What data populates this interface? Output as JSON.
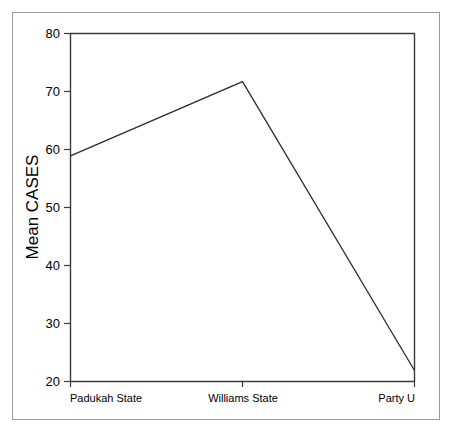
{
  "chart_data": {
    "type": "line",
    "title": "",
    "xlabel": "",
    "ylabel": "Mean CASES",
    "categories": [
      "Padukah State",
      "Williams State",
      "Party U"
    ],
    "values": [
      58.9,
      71.7,
      21.9
    ],
    "series": [
      {
        "name": "Mean CASES",
        "values": [
          58.9,
          71.7,
          21.9
        ]
      }
    ],
    "ylim": [
      20,
      80
    ],
    "yticks": [
      20,
      30,
      40,
      50,
      60,
      70,
      80
    ],
    "ytick_labels": [
      "20",
      "30",
      "40",
      "50",
      "60",
      "70",
      "80"
    ],
    "grid": false,
    "legend": false,
    "legend_position": "none",
    "line_color": "#2b2b2b",
    "axis_color": "#3a3a3a",
    "frame_color": "#9a9a9a",
    "background_color": "#ffffff"
  },
  "axis": {
    "y_title": "Mean CASES",
    "ticks": {
      "t80": "80",
      "t70": "70",
      "t60": "60",
      "t50": "50",
      "t40": "40",
      "t30": "30",
      "t20": "20"
    },
    "categories": {
      "c0": "Padukah State",
      "c1": "Williams State",
      "c2": "Party U"
    }
  }
}
